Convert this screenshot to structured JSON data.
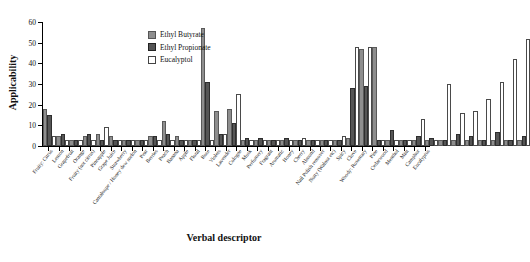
{
  "chart_data": {
    "type": "bar",
    "title": "",
    "xlabel": "Verbal descriptor",
    "ylabel": "Applicability",
    "ylim": [
      0,
      60
    ],
    "yticks": [
      0,
      10,
      20,
      30,
      40,
      50,
      60
    ],
    "grid": false,
    "legend_position": "top-center",
    "categories": [
      "Fruity: Citrus",
      "Lemon",
      "Grapefruit",
      "Orange",
      "Fruity (not citrus)",
      "Pineapple",
      "Grape Juice",
      "Strawberry",
      "Cantaloupe / Honey dew melon",
      "Pear",
      "Berries",
      "Peach",
      "Banana",
      "Apple",
      "Floral",
      "Rose",
      "Violets",
      "Lavender",
      "Cologne",
      "Musk",
      "Perfumery",
      "Fragrant",
      "Aromatic",
      "Honey",
      "Cherry",
      "Almond",
      "Nail Polish remover",
      "Nutty (Walnut etc)",
      "Spicy",
      "Clove",
      "Woody: Rosemary",
      "Pine",
      "Cedarwood",
      "Menthol",
      "Mint",
      "Camphor",
      "Eucalyptus"
    ],
    "series": [
      {
        "name": "Ethyl Butyrate",
        "color": "#8e8e8e",
        "values": [
          17,
          4,
          2,
          4,
          5,
          4,
          2,
          2,
          4,
          11,
          4,
          2,
          56,
          16,
          17,
          2,
          2,
          2,
          2,
          2,
          2,
          2,
          2,
          3,
          46,
          47,
          2,
          2,
          2,
          2,
          2,
          2,
          2,
          2,
          2,
          2,
          2
        ]
      },
      {
        "name": "Ethyl Propionate",
        "color": "#555555",
        "values": [
          14,
          5,
          2,
          5,
          2,
          2,
          2,
          2,
          4,
          5,
          2,
          2,
          30,
          5,
          10,
          3,
          3,
          2,
          3,
          2,
          2,
          2,
          2,
          27,
          28,
          2,
          7,
          2,
          4,
          3,
          2,
          5,
          4,
          2,
          6,
          2,
          4
        ]
      },
      {
        "name": "Eucalyptol",
        "color": "#ffffff",
        "values": [
          4,
          2,
          2,
          2,
          8,
          2,
          2,
          2,
          2,
          2,
          2,
          2,
          2,
          5,
          24,
          2,
          2,
          2,
          2,
          3,
          2,
          2,
          4,
          47,
          47,
          2,
          2,
          2,
          12,
          2,
          29,
          15,
          16,
          22,
          30,
          41,
          51
        ]
      }
    ]
  },
  "legend": {
    "items": [
      {
        "label": "Ethyl Butyrate"
      },
      {
        "label": "Ethyl Propionate"
      },
      {
        "label": "Eucalyptol"
      }
    ]
  }
}
